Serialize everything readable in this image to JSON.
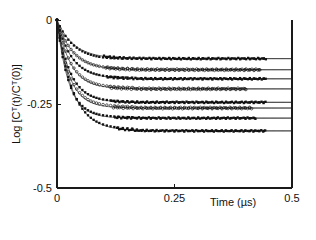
{
  "chart_data": {
    "type": "scatter",
    "title": "",
    "xlabel": "Time  (µs)",
    "ylabel": "Log [Cᵀ(t)/Cᵀ(0)]",
    "xlim": [
      0,
      0.5
    ],
    "ylim": [
      -0.5,
      0
    ],
    "xticks": [
      0,
      0.25,
      0.5
    ],
    "xticklabels": [
      "0",
      "0.25",
      "0.5"
    ],
    "yticks": [
      0,
      -0.25,
      -0.5
    ],
    "yticklabels": [
      "0",
      "-0.25",
      "-0.5"
    ],
    "grid": false,
    "legend": "none",
    "series": [
      {
        "name": "trace-1",
        "marker": "filled-square",
        "plateau": -0.115,
        "rate_per_us": 28.0,
        "x": [
          0,
          0.006,
          0.012,
          0.018,
          0.024,
          0.03,
          0.036,
          0.042,
          0.048,
          0.054,
          0.06,
          0.066,
          0.072,
          0.078,
          0.084,
          0.09,
          0.098,
          0.106,
          0.114,
          0.122,
          0.13,
          0.14,
          0.15,
          0.16,
          0.17,
          0.18,
          0.19,
          0.2,
          0.21,
          0.22,
          0.23,
          0.24,
          0.25,
          0.26,
          0.27,
          0.28,
          0.29,
          0.3,
          0.31,
          0.32,
          0.33,
          0.34,
          0.35,
          0.36,
          0.37,
          0.38,
          0.39,
          0.4,
          0.41,
          0.42,
          0.43,
          0.44
        ],
        "y": [
          0,
          -0.0185,
          -0.0342,
          -0.0474,
          -0.0586,
          -0.068,
          -0.0759,
          -0.0826,
          -0.0883,
          -0.0931,
          -0.0971,
          -0.1005,
          -0.1034,
          -0.1059,
          -0.1079,
          -0.1097,
          -0.1113,
          -0.1126,
          -0.1135,
          -0.1141,
          -0.1145,
          -0.1148,
          -0.115,
          -0.1151,
          -0.115,
          -0.1149,
          -0.1151,
          -0.115,
          -0.1148,
          -0.1152,
          -0.115,
          -0.1149,
          -0.1151,
          -0.115,
          -0.1148,
          -0.1151,
          -0.115,
          -0.1152,
          -0.1149,
          -0.115,
          -0.1151,
          -0.1148,
          -0.115,
          -0.1152,
          -0.1149,
          -0.115,
          -0.1151,
          -0.1149,
          -0.115,
          -0.1152,
          -0.1148,
          -0.115
        ]
      },
      {
        "name": "trace-2",
        "marker": "open-circle",
        "plateau": -0.148,
        "rate_per_us": 30.0,
        "x": [
          0,
          0.006,
          0.012,
          0.018,
          0.024,
          0.03,
          0.036,
          0.042,
          0.048,
          0.054,
          0.06,
          0.066,
          0.072,
          0.078,
          0.084,
          0.09,
          0.098,
          0.106,
          0.114,
          0.122,
          0.13,
          0.14,
          0.15,
          0.16,
          0.17,
          0.18,
          0.19,
          0.2,
          0.21,
          0.22,
          0.23,
          0.24,
          0.25,
          0.26,
          0.27,
          0.28,
          0.29,
          0.3,
          0.31,
          0.32,
          0.33,
          0.34,
          0.35,
          0.36,
          0.37,
          0.38,
          0.39,
          0.4,
          0.41,
          0.42,
          0.43
        ],
        "y": [
          0,
          -0.0244,
          -0.0448,
          -0.0618,
          -0.076,
          -0.0878,
          -0.0977,
          -0.1059,
          -0.1128,
          -0.1185,
          -0.1233,
          -0.1273,
          -0.1307,
          -0.1335,
          -0.1358,
          -0.1378,
          -0.1397,
          -0.1411,
          -0.1422,
          -0.1431,
          -0.1437,
          -0.1443,
          -0.1446,
          -0.1449,
          -0.1475,
          -0.148,
          -0.1478,
          -0.148,
          -0.1481,
          -0.1479,
          -0.148,
          -0.1482,
          -0.1479,
          -0.148,
          -0.1481,
          -0.1478,
          -0.148,
          -0.1482,
          -0.1479,
          -0.148,
          -0.1481,
          -0.1479,
          -0.148,
          -0.1482,
          -0.1478,
          -0.148,
          -0.1481,
          -0.1479,
          -0.148,
          -0.1482,
          -0.1479
        ]
      },
      {
        "name": "trace-3",
        "marker": "filled-square",
        "plateau": -0.175,
        "rate_per_us": 32.0,
        "x": [
          0,
          0.006,
          0.012,
          0.018,
          0.024,
          0.03,
          0.036,
          0.042,
          0.048,
          0.054,
          0.06,
          0.066,
          0.072,
          0.078,
          0.084,
          0.09,
          0.098,
          0.106,
          0.114,
          0.122,
          0.13,
          0.14,
          0.15,
          0.16,
          0.17,
          0.18,
          0.19,
          0.2,
          0.21,
          0.22,
          0.23,
          0.24,
          0.25,
          0.26,
          0.27,
          0.28,
          0.29,
          0.3,
          0.31,
          0.32,
          0.33,
          0.34,
          0.35,
          0.36,
          0.37,
          0.38,
          0.39,
          0.4,
          0.41,
          0.42,
          0.43,
          0.44
        ],
        "y": [
          0,
          -0.0304,
          -0.0555,
          -0.0762,
          -0.0933,
          -0.1074,
          -0.1189,
          -0.1285,
          -0.1363,
          -0.1428,
          -0.1482,
          -0.1526,
          -0.1562,
          -0.1592,
          -0.1617,
          -0.1637,
          -0.1657,
          -0.1672,
          -0.1684,
          -0.1693,
          -0.17,
          -0.1707,
          -0.1712,
          -0.1716,
          -0.1745,
          -0.175,
          -0.1748,
          -0.175,
          -0.1752,
          -0.1749,
          -0.175,
          -0.1751,
          -0.1748,
          -0.175,
          -0.1752,
          -0.1749,
          -0.175,
          -0.1751,
          -0.1748,
          -0.175,
          -0.1752,
          -0.1749,
          -0.175,
          -0.1751,
          -0.1749,
          -0.175,
          -0.1752,
          -0.1748,
          -0.175,
          -0.1751,
          -0.1749,
          -0.175
        ]
      },
      {
        "name": "trace-4",
        "marker": "open-circle",
        "plateau": -0.205,
        "rate_per_us": 34.0,
        "x": [
          0,
          0.006,
          0.012,
          0.018,
          0.024,
          0.03,
          0.036,
          0.042,
          0.048,
          0.054,
          0.06,
          0.066,
          0.072,
          0.078,
          0.084,
          0.09,
          0.098,
          0.106,
          0.114,
          0.122,
          0.13,
          0.14,
          0.15,
          0.16,
          0.17,
          0.18,
          0.19,
          0.2,
          0.21,
          0.22,
          0.23,
          0.24,
          0.25,
          0.26,
          0.27,
          0.28,
          0.29,
          0.3,
          0.31,
          0.32,
          0.33,
          0.34,
          0.35,
          0.36,
          0.37,
          0.38,
          0.39,
          0.4
        ],
        "y": [
          0,
          -0.0375,
          -0.0681,
          -0.0929,
          -0.1132,
          -0.1297,
          -0.1431,
          -0.1541,
          -0.163,
          -0.1702,
          -0.1762,
          -0.181,
          -0.1849,
          -0.1881,
          -0.1907,
          -0.1929,
          -0.1949,
          -0.1964,
          -0.1976,
          -0.1985,
          -0.1992,
          -0.1999,
          -0.2004,
          -0.2008,
          -0.2045,
          -0.205,
          -0.2048,
          -0.205,
          -0.2052,
          -0.2049,
          -0.205,
          -0.2051,
          -0.2048,
          -0.205,
          -0.2052,
          -0.2049,
          -0.205,
          -0.2051,
          -0.2049,
          -0.205,
          -0.2052,
          -0.2048,
          -0.205,
          -0.2051,
          -0.2049,
          -0.205,
          -0.2052,
          -0.2049
        ]
      },
      {
        "name": "trace-5",
        "marker": "filled-square",
        "plateau": -0.245,
        "rate_per_us": 36.0,
        "x": [
          0,
          0.006,
          0.012,
          0.018,
          0.024,
          0.03,
          0.036,
          0.042,
          0.048,
          0.054,
          0.06,
          0.066,
          0.072,
          0.078,
          0.084,
          0.09,
          0.098,
          0.106,
          0.114,
          0.122,
          0.13,
          0.14,
          0.15,
          0.16,
          0.17,
          0.18,
          0.19,
          0.2,
          0.21,
          0.22,
          0.23,
          0.24,
          0.25,
          0.26,
          0.27,
          0.28,
          0.29,
          0.3,
          0.31,
          0.32,
          0.33,
          0.34,
          0.35,
          0.36,
          0.37,
          0.38,
          0.39,
          0.4,
          0.41,
          0.42,
          0.43,
          0.44
        ],
        "y": [
          0,
          -0.0471,
          -0.0851,
          -0.1157,
          -0.1404,
          -0.1603,
          -0.1764,
          -0.1894,
          -0.1999,
          -0.2083,
          -0.2152,
          -0.2207,
          -0.2252,
          -0.2288,
          -0.2317,
          -0.2341,
          -0.2364,
          -0.2381,
          -0.2394,
          -0.2405,
          -0.2413,
          -0.2421,
          -0.2426,
          -0.243,
          -0.2448,
          -0.245,
          -0.2449,
          -0.245,
          -0.2452,
          -0.2448,
          -0.245,
          -0.2451,
          -0.2449,
          -0.245,
          -0.2452,
          -0.2448,
          -0.245,
          -0.2451,
          -0.2449,
          -0.245,
          -0.2452,
          -0.2449,
          -0.245,
          -0.2451,
          -0.2448,
          -0.245,
          -0.2452,
          -0.2449,
          -0.245,
          -0.2451,
          -0.2449,
          -0.245
        ]
      },
      {
        "name": "trace-6",
        "marker": "open-circle",
        "plateau": -0.262,
        "rate_per_us": 38.0,
        "x": [
          0,
          0.006,
          0.012,
          0.018,
          0.024,
          0.03,
          0.036,
          0.042,
          0.048,
          0.054,
          0.06,
          0.066,
          0.072,
          0.078,
          0.084,
          0.09,
          0.098,
          0.106,
          0.114,
          0.122,
          0.13,
          0.14,
          0.15,
          0.16,
          0.17,
          0.18,
          0.19,
          0.2,
          0.21,
          0.22,
          0.23,
          0.24,
          0.25,
          0.26,
          0.27,
          0.28,
          0.29,
          0.3,
          0.31,
          0.32,
          0.33,
          0.34,
          0.35,
          0.36,
          0.37,
          0.38,
          0.39,
          0.4,
          0.41
        ],
        "y": [
          0,
          -0.0527,
          -0.0946,
          -0.1279,
          -0.1545,
          -0.1756,
          -0.1924,
          -0.2057,
          -0.2163,
          -0.2248,
          -0.2315,
          -0.2369,
          -0.2412,
          -0.2446,
          -0.2473,
          -0.2495,
          -0.2517,
          -0.2532,
          -0.2545,
          -0.2554,
          -0.2562,
          -0.2569,
          -0.2574,
          -0.2578,
          -0.2615,
          -0.262,
          -0.2618,
          -0.262,
          -0.2622,
          -0.2619,
          -0.262,
          -0.2621,
          -0.2618,
          -0.262,
          -0.2622,
          -0.2619,
          -0.262,
          -0.2621,
          -0.2619,
          -0.262,
          -0.2622,
          -0.2618,
          -0.262,
          -0.2621,
          -0.2619,
          -0.262,
          -0.2622,
          -0.2619,
          -0.262
        ]
      },
      {
        "name": "trace-7",
        "marker": "filled-square",
        "plateau": -0.292,
        "rate_per_us": 40.0,
        "x": [
          0,
          0.006,
          0.012,
          0.018,
          0.024,
          0.03,
          0.036,
          0.042,
          0.048,
          0.054,
          0.06,
          0.066,
          0.072,
          0.078,
          0.084,
          0.09,
          0.098,
          0.106,
          0.114,
          0.122,
          0.13,
          0.14,
          0.15,
          0.16,
          0.17,
          0.18,
          0.19,
          0.2,
          0.21,
          0.22,
          0.23,
          0.24,
          0.25,
          0.26,
          0.27,
          0.28,
          0.29,
          0.3,
          0.31,
          0.32,
          0.33,
          0.34,
          0.35,
          0.36,
          0.37,
          0.38,
          0.39,
          0.4,
          0.41,
          0.42
        ],
        "y": [
          0,
          -0.0617,
          -0.1103,
          -0.1485,
          -0.1786,
          -0.2022,
          -0.2208,
          -0.2354,
          -0.2469,
          -0.2559,
          -0.263,
          -0.2686,
          -0.273,
          -0.2765,
          -0.2792,
          -0.2814,
          -0.2835,
          -0.285,
          -0.2862,
          -0.2871,
          -0.2878,
          -0.2884,
          -0.2889,
          -0.2892,
          -0.2915,
          -0.292,
          -0.2918,
          -0.292,
          -0.2922,
          -0.2919,
          -0.292,
          -0.2921,
          -0.2918,
          -0.292,
          -0.2922,
          -0.2919,
          -0.292,
          -0.2921,
          -0.2919,
          -0.292,
          -0.2922,
          -0.2918,
          -0.292,
          -0.2921,
          -0.2919,
          -0.292,
          -0.2922,
          -0.2919,
          -0.292,
          -0.2921
        ]
      },
      {
        "name": "trace-8",
        "marker": "filled-square",
        "plateau": -0.33,
        "rate_per_us": 30.0,
        "x": [
          0,
          0.006,
          0.012,
          0.018,
          0.024,
          0.03,
          0.036,
          0.042,
          0.048,
          0.054,
          0.06,
          0.066,
          0.072,
          0.078,
          0.084,
          0.09,
          0.098,
          0.106,
          0.114,
          0.122,
          0.13,
          0.14,
          0.15,
          0.16,
          0.17,
          0.18,
          0.19,
          0.2,
          0.21,
          0.22,
          0.23,
          0.24,
          0.25,
          0.26,
          0.27,
          0.28,
          0.29,
          0.3,
          0.31,
          0.32,
          0.33,
          0.34,
          0.35,
          0.36,
          0.37,
          0.38,
          0.39,
          0.4,
          0.41,
          0.42,
          0.43,
          0.44
        ],
        "y": [
          0,
          -0.0544,
          -0.0999,
          -0.1378,
          -0.1695,
          -0.1959,
          -0.2179,
          -0.2362,
          -0.2515,
          -0.2642,
          -0.2748,
          -0.2836,
          -0.291,
          -0.2971,
          -0.3022,
          -0.3064,
          -0.3108,
          -0.3141,
          -0.3166,
          -0.3186,
          -0.3201,
          -0.3215,
          -0.3224,
          -0.3231,
          -0.329,
          -0.33,
          -0.3298,
          -0.33,
          -0.3302,
          -0.3299,
          -0.33,
          -0.3301,
          -0.3298,
          -0.33,
          -0.3302,
          -0.3299,
          -0.33,
          -0.3301,
          -0.3298,
          -0.33,
          -0.3302,
          -0.3299,
          -0.33,
          -0.3301,
          -0.3299,
          -0.33,
          -0.3302,
          -0.3298,
          -0.33,
          -0.3301,
          -0.3299,
          -0.33
        ]
      }
    ]
  },
  "colors": {
    "axis": "#1a1a1a",
    "marker": "#111111",
    "fit": "#2b2b2b",
    "background": "#ffffff"
  }
}
